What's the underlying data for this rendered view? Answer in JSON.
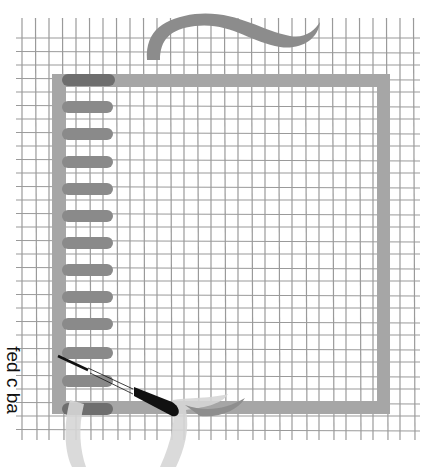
{
  "diagram": {
    "label": "fed c ba",
    "colors": {
      "grid": "#9a9a9a",
      "band": "#a6a6a6",
      "stitch": "#8a8a8a",
      "stitch_dark": "#6e6e6e",
      "yarn_light": "#d9d9d9",
      "needle": "#111111"
    },
    "grid": {
      "x0": 22,
      "y0": 18,
      "x1": 414,
      "y1": 440,
      "step_x": 13.5,
      "step_y": 13.5
    },
    "frame": {
      "left": 52,
      "top": 74,
      "right": 390,
      "bottom": 414,
      "thickness": 13
    },
    "stitches": [
      {
        "y": 80,
        "x1": 62,
        "x2": 115,
        "dark": true
      },
      {
        "y": 107,
        "x1": 62,
        "x2": 113
      },
      {
        "y": 134,
        "x1": 62,
        "x2": 113
      },
      {
        "y": 162,
        "x1": 62,
        "x2": 113
      },
      {
        "y": 189,
        "x1": 62,
        "x2": 113
      },
      {
        "y": 216,
        "x1": 62,
        "x2": 113
      },
      {
        "y": 243,
        "x1": 62,
        "x2": 113
      },
      {
        "y": 270,
        "x1": 62,
        "x2": 113
      },
      {
        "y": 297,
        "x1": 62,
        "x2": 113
      },
      {
        "y": 324,
        "x1": 62,
        "x2": 113
      },
      {
        "y": 353,
        "x1": 62,
        "x2": 113
      },
      {
        "y": 381,
        "x1": 62,
        "x2": 113
      },
      {
        "y": 409,
        "x1": 62,
        "x2": 113,
        "dark": true
      }
    ],
    "needle": {
      "x1": 58,
      "y1": 356,
      "x2": 178,
      "y2": 414
    }
  }
}
